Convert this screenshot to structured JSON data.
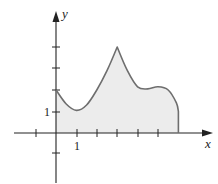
{
  "figure": {
    "x_axis_label": "x",
    "y_axis_label": "y",
    "x_tick_label": "1",
    "y_tick_label": "1"
  },
  "colors": {
    "fill": "#ececec",
    "curve": "#6e6e6e",
    "axes": "#222222"
  },
  "chart_data": {
    "type": "area",
    "title": "",
    "xlabel": "x",
    "ylabel": "y",
    "xlim": [
      -2,
      6.5
    ],
    "ylim": [
      -2,
      5
    ],
    "x_ticks": [
      -1,
      1,
      2,
      3,
      4,
      5
    ],
    "y_ticks": [
      -1,
      1,
      2,
      3,
      4
    ],
    "labeled_ticks": {
      "x": [
        1
      ],
      "y": [
        1
      ]
    },
    "grid": false,
    "legend": null,
    "shaded_region": "area under curve from x=0 to x=6",
    "curve_points": [
      {
        "x": 0,
        "y": 2.0
      },
      {
        "x": 0.5,
        "y": 1.35
      },
      {
        "x": 1.0,
        "y": 1.05
      },
      {
        "x": 1.5,
        "y": 1.3
      },
      {
        "x": 2.0,
        "y": 2.0
      },
      {
        "x": 2.5,
        "y": 2.9
      },
      {
        "x": 3.0,
        "y": 4.0
      },
      {
        "x": 3.5,
        "y": 2.9
      },
      {
        "x": 4.0,
        "y": 2.15
      },
      {
        "x": 4.5,
        "y": 2.05
      },
      {
        "x": 5.0,
        "y": 2.15
      },
      {
        "x": 5.5,
        "y": 2.0
      },
      {
        "x": 5.9,
        "y": 1.4
      },
      {
        "x": 6.0,
        "y": 1.0
      },
      {
        "x": 6.0,
        "y": 0
      }
    ]
  }
}
